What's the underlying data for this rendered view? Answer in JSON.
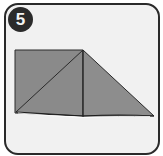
{
  "step": {
    "number": "5"
  },
  "colors": {
    "frame_border": "#2a2a2a",
    "frame_fill": "#f1f1f1",
    "badge_fill": "#2b2b2b",
    "paper_fill": "#8a8a8a",
    "paper_line": "#2a2a2a"
  }
}
